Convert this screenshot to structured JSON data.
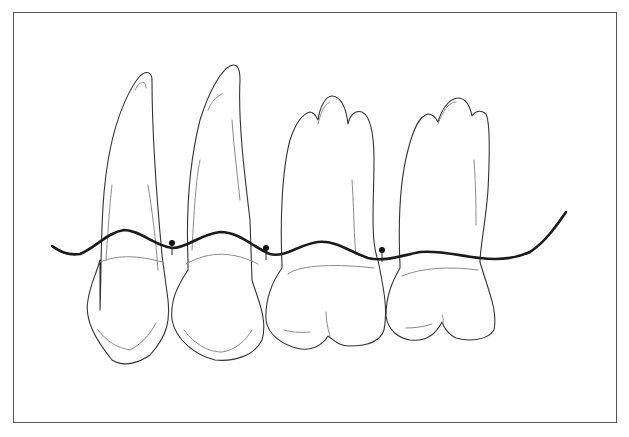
{
  "figure": {
    "type": "dental-line-drawing",
    "teeth": [
      {
        "id": "tooth-1",
        "label": "canine-like"
      },
      {
        "id": "tooth-2",
        "label": "premolar-like"
      },
      {
        "id": "tooth-3",
        "label": "molar-1"
      },
      {
        "id": "tooth-4",
        "label": "molar-2"
      }
    ],
    "contact_points": 3,
    "colors": {
      "outline": "#333333",
      "gingival_line": "#1a1a1a",
      "frame": "#555555",
      "background": "#ffffff"
    }
  }
}
